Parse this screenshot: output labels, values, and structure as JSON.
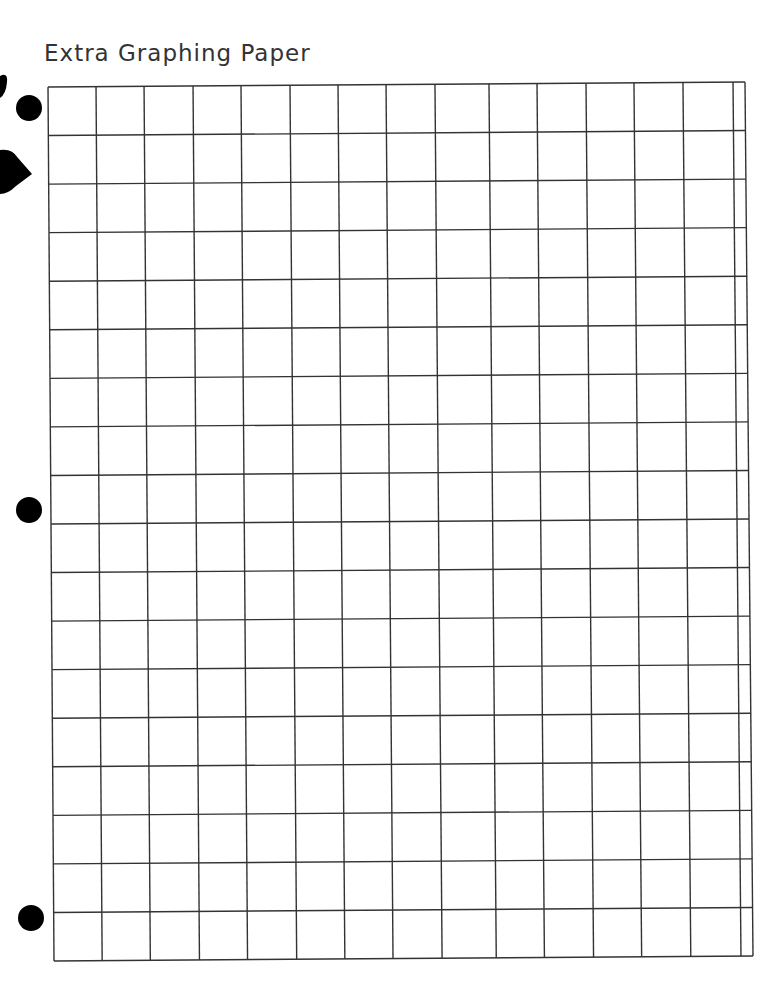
{
  "page": {
    "title": "Extra Graphing Paper"
  },
  "grid": {
    "rows": 18,
    "full_columns": 14,
    "partial_columns": 1,
    "line_color": "#333333",
    "corners": {
      "top_left": [
        48,
        87
      ],
      "top_right": [
        745,
        82
      ],
      "bottom_left": [
        54,
        961
      ],
      "bottom_right": [
        753,
        956
      ]
    },
    "column_fractions": [
      0,
      0.0689,
      0.1378,
      0.2081,
      0.2769,
      0.3472,
      0.4161,
      0.485,
      0.5552,
      0.6327,
      0.7016,
      0.7719,
      0.8407,
      0.911,
      0.9828,
      1
    ],
    "row_count": 18
  },
  "punch_holes": [
    {
      "cx": 29,
      "cy": 108
    },
    {
      "cx": 29,
      "cy": 510
    },
    {
      "cx": 31,
      "cy": 918
    }
  ],
  "colors": {
    "paper": "#ffffff",
    "ink": "#000000",
    "title": "#333333"
  }
}
